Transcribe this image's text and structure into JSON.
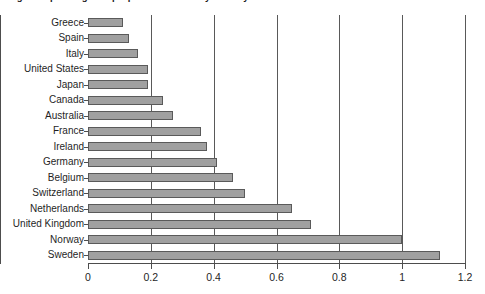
{
  "figure": {
    "title": "Figure: Spending as a proportion of GDP by country",
    "title_visible_fragment": "g"
  },
  "chart_data": {
    "type": "bar",
    "orientation": "horizontal",
    "title": "",
    "xlabel": "",
    "ylabel": "",
    "xlim": [
      0,
      1.2
    ],
    "xticks": [
      0,
      0.2,
      0.4,
      0.6,
      0.8,
      1,
      1.2
    ],
    "xtick_labels": [
      "0",
      "0.2",
      "0.4",
      "0.6",
      "0.8",
      "1",
      "1.2"
    ],
    "grid": true,
    "grid_axis": "x",
    "legend": false,
    "bar_color": "#a0a0a0",
    "bar_edge_color": "#5a5a5a",
    "categories": [
      "Greece",
      "Spain",
      "Italy",
      "United States",
      "Japan",
      "Canada",
      "Australia",
      "France",
      "Ireland",
      "Germany",
      "Belgium",
      "Switzerland",
      "Netherlands",
      "United Kingdom",
      "Norway",
      "Sweden"
    ],
    "values": [
      0.11,
      0.13,
      0.16,
      0.19,
      0.19,
      0.24,
      0.27,
      0.36,
      0.38,
      0.41,
      0.46,
      0.5,
      0.65,
      0.71,
      1.0,
      1.12
    ]
  }
}
